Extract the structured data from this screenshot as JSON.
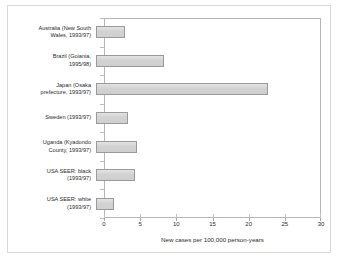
{
  "chart_data": {
    "type": "bar",
    "orientation": "horizontal",
    "title": "",
    "xlabel": "New cases per 100,000 person-years",
    "ylabel": "",
    "xlim": [
      0,
      30
    ],
    "xticks": [
      0,
      5,
      10,
      15,
      20,
      25,
      30
    ],
    "grid": false,
    "legend": null,
    "categories": [
      "Australia (New South Wales, 1993/97)",
      "Brazil (Goiania, 1995/98)",
      "Japan (Osaka prefecture, 1993/97)",
      "Sweden (1993/97)",
      "Uganda (Kyadondo County, 1993/97)",
      "USA SEER: black (1993/97)",
      "USA SEER: white (1993/97)"
    ],
    "category_lines": [
      "Australia (New South\nWales, 1993/97)",
      "Brazil (Goiania,\n1995/98)",
      "Japan (Osaka\nprefecture, 1993/97)",
      "Sweden (1993/97)",
      "Uganda (Kyadondo\nCounty, 1993/97)",
      "USA SEER: black\n(1993/97)",
      "USA SEER: white\n(1993/97)"
    ],
    "values": [
      4.0,
      9.4,
      23.8,
      4.4,
      5.6,
      5.4,
      2.5
    ],
    "tick_labels": [
      "0",
      "5",
      "10",
      "15",
      "20",
      "25",
      "30"
    ],
    "colors": {
      "bar_fill": "#d2d2d2",
      "bar_border": "#9a9a9a",
      "axis": "#b6b6b6",
      "text": "#2b2b2b",
      "frame": "#d9d9d9",
      "background": "#ffffff"
    }
  }
}
